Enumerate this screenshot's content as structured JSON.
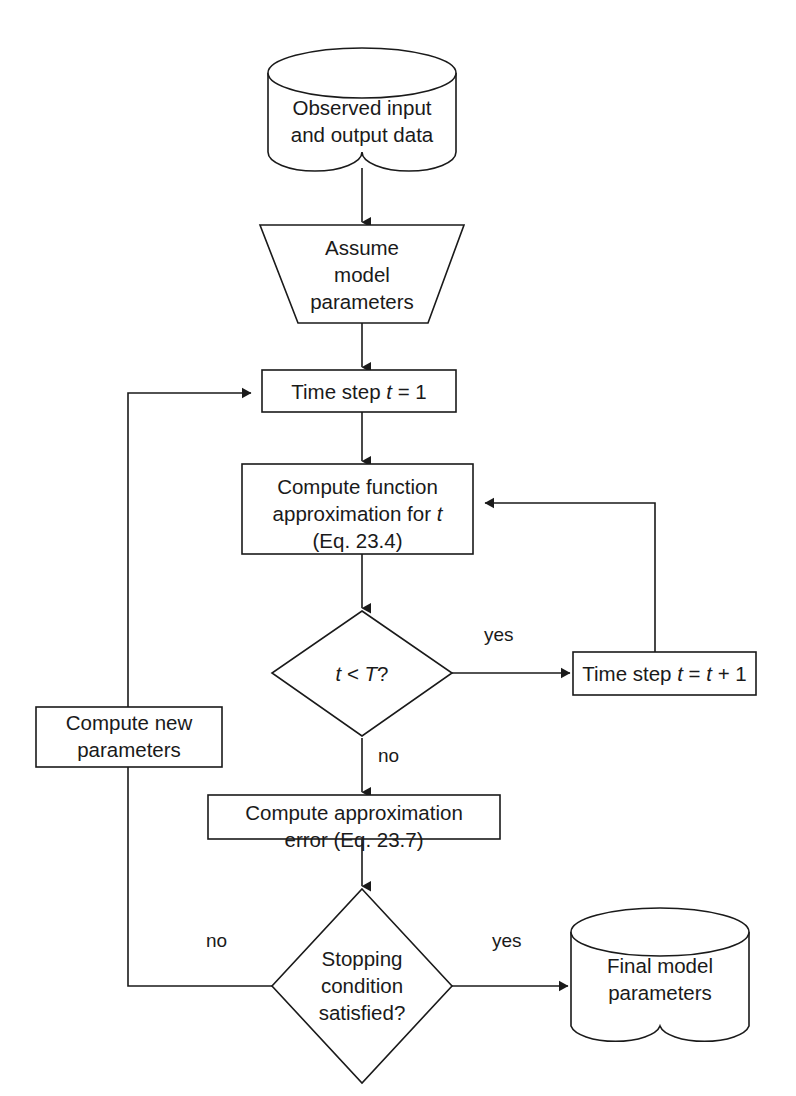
{
  "diagram": {
    "stroke_color": "#1a1a1a",
    "fill_color": "#ffffff",
    "nodes": {
      "observed_data": {
        "shape": "cylinder",
        "line1": "Observed input",
        "line2": "and output data"
      },
      "assume_parameters": {
        "shape": "trapezoid",
        "line1": "Assume",
        "line2": "model",
        "line3": "parameters"
      },
      "time_step_init": {
        "shape": "rectangle",
        "prefix": "Time step ",
        "var": "t",
        "suffix": " = 1"
      },
      "compute_function": {
        "shape": "rectangle",
        "line1": "Compute function",
        "line2_prefix": "approximation for ",
        "line2_var": "t",
        "line3": "(Eq. 23.4)"
      },
      "time_decision": {
        "shape": "diamond",
        "var_left": "t",
        "operator": " < ",
        "var_right": "T",
        "suffix": "?"
      },
      "time_step_increment": {
        "shape": "rectangle",
        "prefix": "Time step ",
        "var1": "t",
        "mid": " = ",
        "var2": "t",
        "suffix": " + 1"
      },
      "compute_new_parameters": {
        "shape": "rectangle",
        "line1": "Compute new",
        "line2": "parameters"
      },
      "compute_error": {
        "shape": "rectangle",
        "line1": "Compute approximation",
        "line2": "error (Eq. 23.7)"
      },
      "stopping_decision": {
        "shape": "diamond",
        "line1": "Stopping",
        "line2": "condition",
        "line3": "satisfied?"
      },
      "final_parameters": {
        "shape": "cylinder",
        "line1": "Final model",
        "line2": "parameters"
      }
    },
    "edge_labels": {
      "time_decision_yes": "yes",
      "time_decision_no": "no",
      "stopping_no": "no",
      "stopping_yes": "yes"
    }
  }
}
